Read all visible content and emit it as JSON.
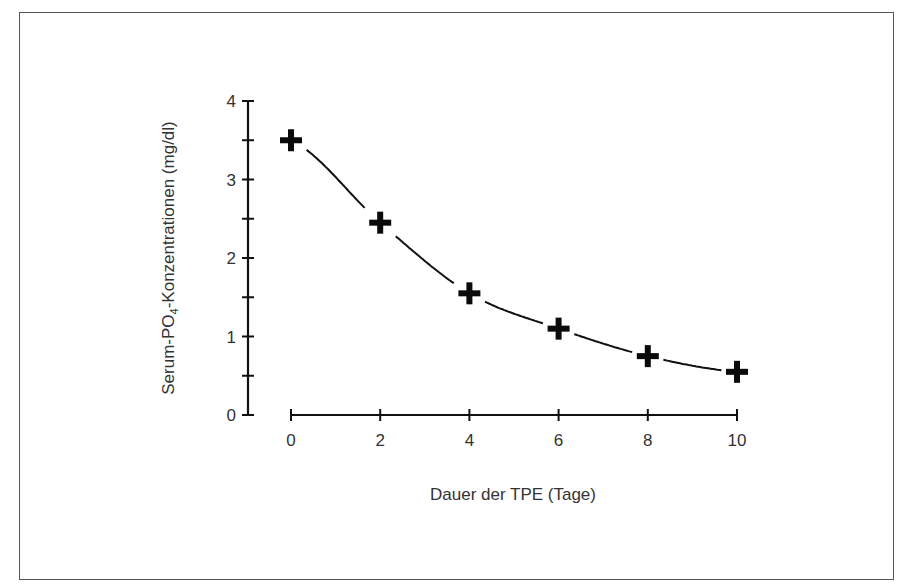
{
  "chart_data": {
    "type": "line",
    "title": "",
    "xlabel": "Dauer der TPE (Tage)",
    "ylabel": "Serum-PO4-Konzentrationen (mg/dl)",
    "ylabel_parts": {
      "main": "Serum-PO",
      "sub": "4",
      "rest": "-Konzentrationen (mg/dl)"
    },
    "x": [
      0,
      2,
      4,
      6,
      8,
      10
    ],
    "values": [
      3.5,
      2.45,
      1.55,
      1.1,
      0.75,
      0.55
    ],
    "xlim": [
      0,
      10
    ],
    "ylim": [
      0,
      4
    ],
    "x_ticks": [
      "0",
      "2",
      "4",
      "6",
      "8",
      "10"
    ],
    "y_ticks": [
      "0",
      "1",
      "2",
      "3",
      "4"
    ],
    "y_minor_ticks": [
      0.5,
      1.5,
      2.5,
      3.5
    ],
    "marker": "plus",
    "line_style": "smooth curve between markers",
    "grid": false,
    "legend": null
  }
}
